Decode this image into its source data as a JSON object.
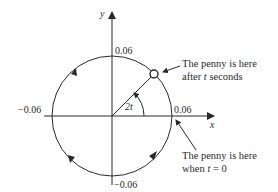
{
  "diagram": {
    "axes": {
      "x_label": "x",
      "y_label": "y"
    },
    "tick_labels": {
      "top": "0.06",
      "right": "0.06",
      "left": "−0.06",
      "bottom": "−0.06"
    },
    "angle_label": "2t",
    "annotations": {
      "penny_after": {
        "line1": "The penny is here",
        "line2_prefix": "after ",
        "line2_var": "t",
        "line2_suffix": " seconds"
      },
      "penny_start": {
        "line1": "The penny is here",
        "line2_prefix": "when ",
        "line2_var": "t",
        "line2_suffix": " = 0"
      }
    },
    "circle": {
      "radius_value": 0.06,
      "direction": "counterclockwise",
      "penny_angle_deg": 45
    },
    "colors": {
      "ink": "#2a2a2a",
      "background": "#ffffff"
    }
  }
}
